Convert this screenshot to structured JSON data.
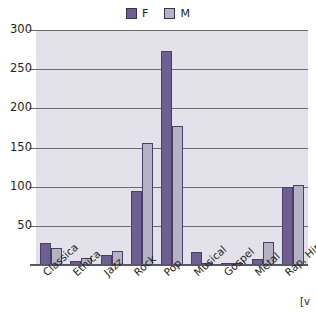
{
  "chart_data": {
    "type": "bar",
    "title": "",
    "xlabel": "",
    "ylabel": "",
    "ylim": [
      0,
      300
    ],
    "yticks": [
      0,
      50,
      100,
      150,
      200,
      250,
      300
    ],
    "ytick_labels": [
      "",
      "50",
      "100",
      "150",
      "200",
      "250",
      "300"
    ],
    "grid": true,
    "legend_position": "top-center",
    "categories": [
      "Classica",
      "Etnica",
      "Jazz",
      "Rock",
      "Pop",
      "Musical",
      "Gospel",
      "Metal",
      "Rap, Hip-hop"
    ],
    "series": [
      {
        "name": "F",
        "color": "#6e5f93",
        "values": [
          28,
          5,
          13,
          95,
          273,
          17,
          2,
          8,
          100
        ]
      },
      {
        "name": "M",
        "color": "#b6b2c6",
        "values": [
          22,
          9,
          18,
          156,
          178,
          3,
          3,
          29,
          102
        ]
      }
    ],
    "annotations": [
      "[v"
    ]
  },
  "legend": {
    "entries": [
      {
        "label": "F",
        "swatch_name": "legend-swatch-f"
      },
      {
        "label": "M",
        "swatch_name": "legend-swatch-m"
      }
    ]
  },
  "colors": {
    "series_f": "#6e5f93",
    "series_m": "#b6b2c6",
    "plot_background": "#e3e1ea",
    "gridline": "#6d6a76",
    "text": "#231f20",
    "page_background": "#ffffff"
  }
}
